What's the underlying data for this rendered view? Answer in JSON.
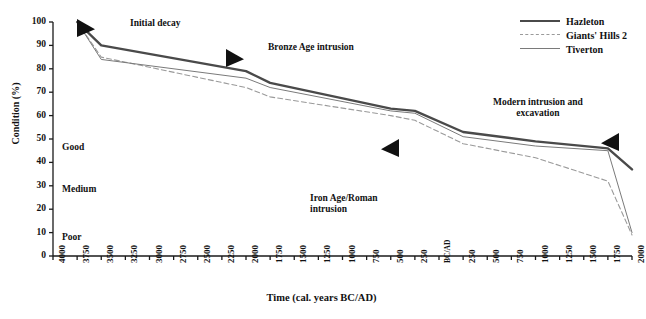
{
  "chart_data": {
    "type": "line",
    "title": "",
    "xlabel": "Time (cal. years BC/AD)",
    "ylabel": "Condition (%)",
    "ylim": [
      0,
      100
    ],
    "ytick_step": 10,
    "grid": false,
    "legend_position": "top-right",
    "ytick_labels": [
      "100",
      "90",
      "80",
      "70",
      "60",
      "50",
      "40",
      "30",
      "20",
      "10",
      "0"
    ],
    "xtick_labels": [
      "4000",
      "3750",
      "3500",
      "3250",
      "3000",
      "2750",
      "2500",
      "2250",
      "2000",
      "1750",
      "1500",
      "1250",
      "1000",
      "750",
      "500",
      "250",
      "BC/AD",
      "250",
      "500",
      "750",
      "1000",
      "1250",
      "1500",
      "1750",
      "2000"
    ],
    "x_numeric": [
      -4000,
      -3750,
      -3500,
      -3250,
      -3000,
      -2750,
      -2500,
      -2250,
      -2000,
      -1750,
      -1500,
      -1250,
      -1000,
      -750,
      -500,
      -250,
      0,
      250,
      500,
      750,
      1000,
      1250,
      1500,
      1750,
      2000
    ],
    "series": [
      {
        "name": "Hazleton",
        "style": "solid-thick",
        "color": "#4a4a4a",
        "x": [
          -3750,
          -3500,
          -2000,
          -1750,
          -500,
          -250,
          250,
          1000,
          1750,
          2000
        ],
        "values": [
          100,
          90,
          79,
          74,
          63,
          62,
          53,
          49,
          46,
          37
        ]
      },
      {
        "name": "Giants' Hills 2",
        "style": "dashed",
        "color": "#9a9a9a",
        "x": [
          -3750,
          -3500,
          -2000,
          -1750,
          -500,
          -250,
          250,
          1000,
          1750,
          2000
        ],
        "values": [
          100,
          85,
          72,
          68,
          60,
          58,
          48,
          42,
          32,
          9
        ]
      },
      {
        "name": "Tiverton",
        "style": "solid-thin",
        "color": "#7a7a7a",
        "x": [
          -3750,
          -3500,
          -2000,
          -1750,
          -500,
          -250,
          250,
          1000,
          1750,
          2000
        ],
        "values": [
          100,
          84,
          76,
          72,
          62,
          61,
          51,
          47,
          45,
          10
        ]
      }
    ],
    "annotations": [
      {
        "name": "initial-decay",
        "text": "Initial  decay",
        "x": 130,
        "y": 18
      },
      {
        "name": "bronze-age-intrusion",
        "text": "Bronze Age intrusion",
        "x": 268,
        "y": 42
      },
      {
        "name": "iron-age-roman-intrusion",
        "text": "Iron Age/Roman\nintrusion",
        "x": 310,
        "y": 193
      },
      {
        "name": "modern-intrusion-and-excavation",
        "text": "Modern intrusion and\nexcavation",
        "x": 493,
        "y": 97
      }
    ],
    "condition_zones": [
      {
        "name": "good",
        "label": "Good",
        "y": 142
      },
      {
        "name": "medium",
        "label": "Medium",
        "y": 184
      },
      {
        "name": "poor",
        "label": "Poor",
        "y": 232
      }
    ],
    "markers": [
      {
        "name": "marker-initial-decay",
        "shape": "triangle-right",
        "x": 86,
        "y": 28
      },
      {
        "name": "marker-bronze-age",
        "shape": "triangle-right",
        "x": 235,
        "y": 58
      },
      {
        "name": "marker-iron-age",
        "shape": "triangle-left",
        "x": 390,
        "y": 148
      },
      {
        "name": "marker-modern",
        "shape": "triangle-left",
        "x": 610,
        "y": 142
      }
    ]
  },
  "legend": {
    "items": [
      {
        "label": "Hazleton",
        "key": "legend-key-hazleton"
      },
      {
        "label": "Giants' Hills 2",
        "key": "legend-key-giants-hills-2"
      },
      {
        "label": "Tiverton",
        "key": "legend-key-tiverton"
      }
    ]
  }
}
